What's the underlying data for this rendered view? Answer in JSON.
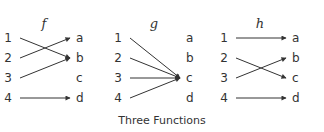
{
  "title": "Three Functions",
  "colors": {
    "ink": "#333333",
    "background": "#ffffff"
  },
  "domain_labels": [
    "1",
    "2",
    "3",
    "4"
  ],
  "codomain_labels": [
    "a",
    "b",
    "c",
    "d"
  ],
  "functions": [
    {
      "name": "f",
      "mapping": {
        "1": "b",
        "2": "a",
        "3": "b",
        "4": "d"
      }
    },
    {
      "name": "g",
      "mapping": {
        "1": "c",
        "2": "c",
        "3": "c",
        "4": "c"
      }
    },
    {
      "name": "h",
      "mapping": {
        "1": "a",
        "2": "c",
        "3": "b",
        "4": "d"
      }
    }
  ]
}
